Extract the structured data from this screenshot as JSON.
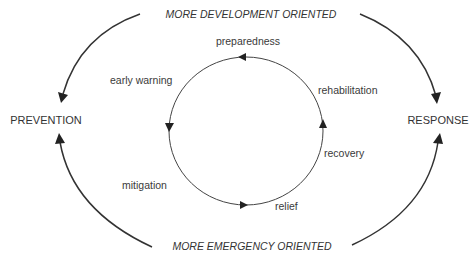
{
  "diagram": {
    "top_axis_label": "MORE DEVELOPMENT ORIENTED",
    "bottom_axis_label": "MORE EMERGENCY ORIENTED",
    "left_pole": "PREVENTION",
    "right_pole": "RESPONSE",
    "cycle_phases": [
      {
        "label": "preparedness"
      },
      {
        "label": "rehabilitation"
      },
      {
        "label": "recovery"
      },
      {
        "label": "relief"
      },
      {
        "label": "mitigation"
      },
      {
        "label": "early warning"
      }
    ],
    "cycle_direction": "counterclockwise",
    "colors": {
      "line": "#333333",
      "text": "#333333",
      "background": "#ffffff"
    }
  }
}
